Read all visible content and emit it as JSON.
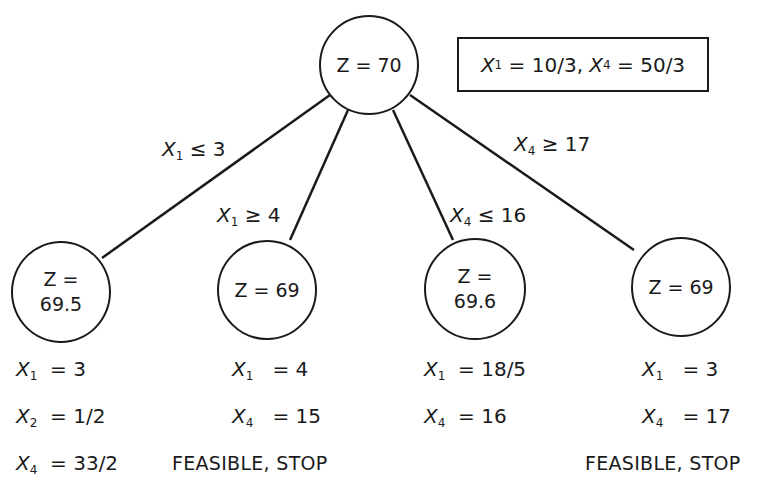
{
  "root": {
    "label": "Z = 70",
    "solution_box": {
      "x1_var": "X",
      "x1_sub": "1",
      "x1_val": "= 10/3,",
      "x4_var": "X",
      "x4_sub": "4",
      "x4_val": "= 50/3"
    }
  },
  "branches": [
    {
      "var": "X",
      "sub": "1",
      "rel": "≤ 3"
    },
    {
      "var": "X",
      "sub": "1",
      "rel": "≥ 4"
    },
    {
      "var": "X",
      "sub": "4",
      "rel": "≤ 16"
    },
    {
      "var": "X",
      "sub": "4",
      "rel": "≥ 17"
    }
  ],
  "nodes": [
    {
      "label_line1": "Z =",
      "label_line2": "69.5",
      "vars": [
        {
          "var": "X",
          "sub": "1",
          "val": "= 3"
        },
        {
          "var": "X",
          "sub": "2",
          "val": "= 1/2"
        },
        {
          "var": "X",
          "sub": "4",
          "val": "= 33/2"
        }
      ],
      "status": ""
    },
    {
      "label_line1": "Z = 69",
      "label_line2": "",
      "vars": [
        {
          "var": "X",
          "sub": "1",
          "val": "= 4"
        },
        {
          "var": "X",
          "sub": "4",
          "val": "= 15"
        }
      ],
      "status": "FEASIBLE, STOP"
    },
    {
      "label_line1": "Z =",
      "label_line2": "69.6",
      "vars": [
        {
          "var": "X",
          "sub": "1",
          "val": "= 18/5"
        },
        {
          "var": "X",
          "sub": "4",
          "val": "= 16"
        }
      ],
      "status": ""
    },
    {
      "label_line1": "Z = 69",
      "label_line2": "",
      "vars": [
        {
          "var": "X",
          "sub": "1",
          "val": "= 3"
        },
        {
          "var": "X",
          "sub": "4",
          "val": "= 17"
        }
      ],
      "status": "FEASIBLE, STOP"
    }
  ]
}
